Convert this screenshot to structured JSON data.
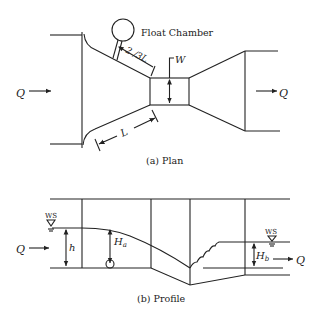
{
  "diagram": {
    "plan": {
      "caption": "(a)  Plan",
      "float_chamber_label": "Float Chamber",
      "dim_upper": "2 /3L",
      "dim_lower": "L",
      "throat_label": "W",
      "flow_in": "Q",
      "flow_out": "Q"
    },
    "profile": {
      "caption": "(b)  Profile",
      "ws_left": "WS",
      "ws_right": "WS",
      "depth_h": "h",
      "head_a": "H",
      "head_a_sub": "a",
      "head_b": "H",
      "head_b_sub": "b",
      "flow_in": "Q",
      "flow_out": "Q"
    }
  }
}
